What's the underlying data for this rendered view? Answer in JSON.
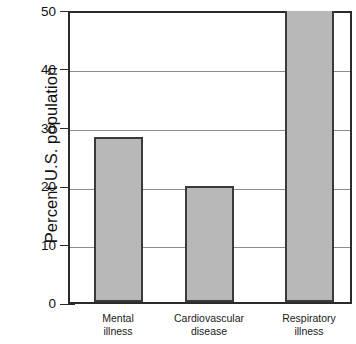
{
  "chart_data": {
    "type": "bar",
    "title": "",
    "xlabel": "",
    "ylabel": "Percent U.S. population",
    "categories": [
      "Mental illness",
      "Cardiovascular disease",
      "Respiratory illness"
    ],
    "category_lines": [
      [
        "Mental",
        "illness"
      ],
      [
        "Cardiovascular",
        "disease"
      ],
      [
        "Respiratory",
        "illness"
      ]
    ],
    "values": [
      28.6,
      20.0,
      50.0
    ],
    "value_notes": [
      "",
      "",
      "bar reaches top of axis (>= 50)"
    ],
    "ylim": [
      0,
      50
    ],
    "ytick_labels": [
      "0",
      "10",
      "20",
      "30",
      "40",
      "50"
    ],
    "ytick_values": [
      0,
      10,
      20,
      30,
      40,
      50
    ],
    "grid": true,
    "legend": "none",
    "colors": {
      "bar_fill": "#b8b8b8",
      "bar_border": "#3a3a3a",
      "axis": "#2b2b2b",
      "gridline": "#8c8c8c",
      "background": "#ffffff",
      "text": "#111111"
    }
  }
}
